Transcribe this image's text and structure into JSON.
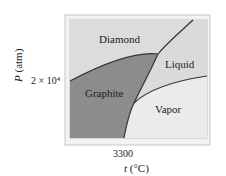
{
  "diagram": {
    "type": "phase-diagram",
    "regions": {
      "diamond": "Diamond",
      "graphite": "Graphite",
      "liquid": "Liquid",
      "vapor": "Vapor"
    },
    "axes": {
      "y_label_var": "P",
      "y_label_unit": " (atm)",
      "y_tick": "2 × 10⁴",
      "x_label_var": "t",
      "x_label_unit": " (°C)",
      "x_tick": "3300"
    },
    "colors": {
      "frame": "#c8c8c8",
      "plot_bg": "#e4e4e4",
      "diamond": "#dcdcdc",
      "graphite": "#8a8a8a",
      "liquid": "#dedede",
      "vapor": "#ececec",
      "curve": "#333333"
    }
  }
}
